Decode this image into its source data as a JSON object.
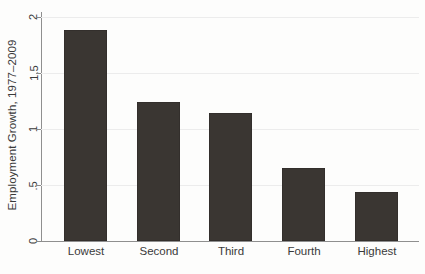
{
  "chart_data": {
    "type": "bar",
    "title": "",
    "subtitle": "",
    "xlabel": "",
    "ylabel": "Employment Growth, 1977–2009",
    "categories": [
      "Lowest",
      "Second",
      "Third",
      "Fourth",
      "Highest"
    ],
    "values": [
      1.88,
      1.24,
      1.14,
      0.65,
      0.44
    ],
    "ylim": [
      0,
      2
    ],
    "ytick_values": [
      0,
      0.5,
      1,
      1.5,
      2
    ],
    "ytick_labels": [
      "0",
      ".5",
      "1",
      "1.5",
      "2"
    ],
    "grid": true,
    "grid_axis": "y",
    "legend": null,
    "legend_position": "none",
    "bar_color": "#3a3632",
    "grid_color": "#ececec",
    "axis_color": "#8f8f8f",
    "background_color": "#fdfdfc",
    "annotations": []
  },
  "caption_strip": {
    "text": ""
  }
}
